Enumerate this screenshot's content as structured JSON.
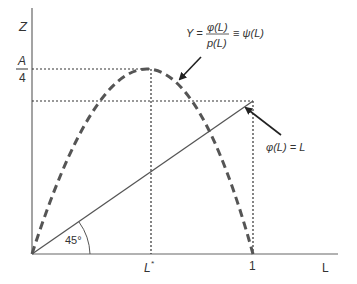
{
  "diagram": {
    "axes": {
      "y_label": "Z",
      "x_label": "L"
    },
    "y_ticks": {
      "a4_numerator": "A",
      "a4_denominator": "4"
    },
    "x_ticks": {
      "l_star_base": "L",
      "l_star_sup": "*",
      "one": "1"
    },
    "angle_label": "45°",
    "curve_label": {
      "lhs": "Y =",
      "numerator": "φ(L)",
      "denominator": "p(L)",
      "rhs": "≡ ψ(L)"
    },
    "line_label": "φ(L) = L",
    "colors": {
      "axis": "#555555",
      "curve": "#555555",
      "guide": "#333333",
      "text": "#333333"
    }
  }
}
